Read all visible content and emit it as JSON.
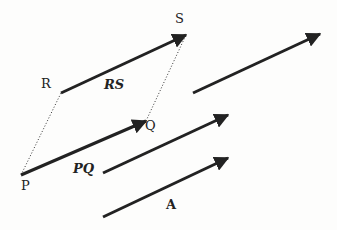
{
  "diagram": {
    "colors": {
      "stroke": "#222222",
      "background": "#fdfdfc"
    },
    "points": {
      "P": {
        "label": "P",
        "x": 21,
        "y": 175
      },
      "Q": {
        "label": "Q",
        "x": 146,
        "y": 121
      },
      "R": {
        "label": "R",
        "x": 61,
        "y": 93
      },
      "S": {
        "label": "S",
        "x": 186,
        "y": 35
      }
    },
    "vectors": [
      {
        "id": "PQ",
        "label": "PQ",
        "from": [
          21,
          175
        ],
        "to": [
          146,
          121
        ]
      },
      {
        "id": "RS",
        "label": "RS",
        "from": [
          61,
          93
        ],
        "to": [
          186,
          35
        ]
      },
      {
        "id": "v3",
        "label": "",
        "from": [
          193,
          93
        ],
        "to": [
          320,
          34
        ]
      },
      {
        "id": "v4",
        "label": "",
        "from": [
          103,
          173
        ],
        "to": [
          228,
          115
        ]
      },
      {
        "id": "A",
        "label": "A",
        "from": [
          103,
          217
        ],
        "to": [
          228,
          158
        ]
      }
    ],
    "dotted_edges": [
      {
        "from": "P",
        "to": "R"
      },
      {
        "from": "Q",
        "to": "S"
      }
    ],
    "labels": {
      "P": "P",
      "Q": "Q",
      "R": "R",
      "S": "S",
      "PQ": "PQ",
      "RS": "RS",
      "A": "A"
    }
  }
}
